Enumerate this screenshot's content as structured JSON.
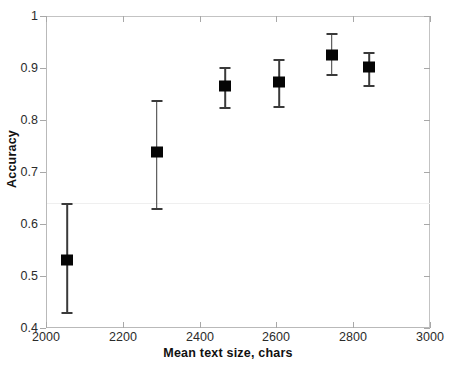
{
  "chart_data": {
    "type": "scatter",
    "title": "",
    "xlabel": "Mean text size, chars",
    "ylabel": "Accuracy",
    "xlim": [
      2000,
      3000
    ],
    "ylim": [
      0.4,
      1.0
    ],
    "xticks": [
      2000,
      2200,
      2400,
      2600,
      2800,
      3000
    ],
    "xtick_labels": [
      "2000",
      "2200",
      "2400",
      "2600",
      "2800",
      "3000"
    ],
    "yticks": [
      0.4,
      0.5,
      0.6,
      0.7,
      0.8,
      0.9,
      1.0
    ],
    "ytick_labels": [
      "0.4",
      "0.5",
      "0.6",
      "0.7",
      "0.8",
      "0.9",
      "1"
    ],
    "grid": false,
    "legend": null,
    "marker": "square",
    "marker_color": "#050505",
    "errorbar_color": "#3a3a3a",
    "reference_line_y": 0.64,
    "x": [
      2055,
      2288,
      2466,
      2607,
      2744,
      2842
    ],
    "y": [
      0.531,
      0.738,
      0.865,
      0.873,
      0.925,
      0.902
    ],
    "yerr_low": [
      0.431,
      0.631,
      0.825,
      0.827,
      0.888,
      0.867
    ],
    "yerr_high": [
      0.64,
      0.838,
      0.902,
      0.917,
      0.967,
      0.93
    ],
    "points": [
      {
        "x": 2055,
        "y": 0.531,
        "low": 0.431,
        "high": 0.64
      },
      {
        "x": 2288,
        "y": 0.738,
        "low": 0.631,
        "high": 0.838
      },
      {
        "x": 2466,
        "y": 0.865,
        "low": 0.825,
        "high": 0.902
      },
      {
        "x": 2607,
        "y": 0.873,
        "low": 0.827,
        "high": 0.917
      },
      {
        "x": 2744,
        "y": 0.925,
        "low": 0.888,
        "high": 0.967
      },
      {
        "x": 2842,
        "y": 0.902,
        "low": 0.867,
        "high": 0.93
      }
    ]
  }
}
